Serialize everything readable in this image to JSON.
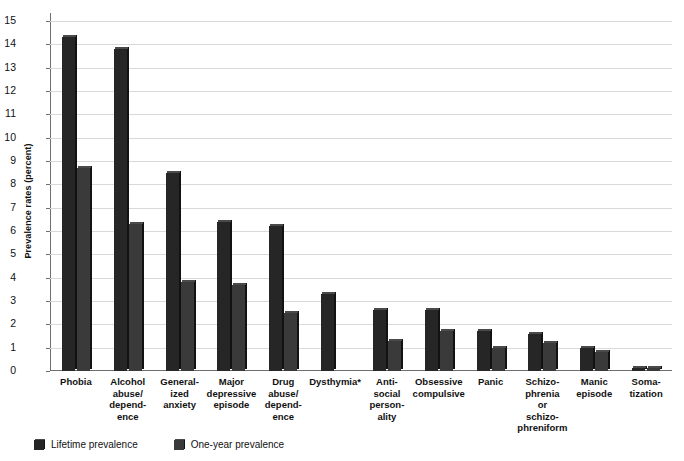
{
  "chart_data": {
    "type": "bar",
    "title": "",
    "xlabel": "",
    "ylabel": "Prevalence rates (percent)",
    "ylim": [
      0,
      15
    ],
    "yticks": [
      0,
      1,
      2,
      3,
      4,
      5,
      6,
      7,
      8,
      9,
      10,
      11,
      12,
      13,
      14,
      15
    ],
    "grid": true,
    "legend_position": "bottom-left",
    "footnote": "*",
    "categories": [
      "Phobia",
      "Alcohol abuse/dependence",
      "Generalized anxiety",
      "Major depressive episode",
      "Drug abuse/dependence",
      "Dysthymia*",
      "Antisocial personality",
      "Obsessive compulsive",
      "Panic",
      "Schizophrenia or schizophreniform",
      "Manic episode",
      "Somatization"
    ],
    "category_lines": [
      [
        "Phobia"
      ],
      [
        "Alcohol",
        "abuse/",
        "depend-",
        "ence"
      ],
      [
        "General-",
        "ized",
        "anxiety"
      ],
      [
        "Major",
        "depressive",
        "episode"
      ],
      [
        "Drug",
        "abuse/",
        "depend-",
        "ence"
      ],
      [
        "Dysthymia*"
      ],
      [
        "Anti-",
        "social",
        "person-",
        "ality"
      ],
      [
        "Obsessive",
        "compulsive"
      ],
      [
        "Panic"
      ],
      [
        "Schizo-",
        "phrenia",
        "or",
        "schizo-",
        "phreniform"
      ],
      [
        "Manic",
        "episode"
      ],
      [
        "Soma-",
        "tization"
      ]
    ],
    "series": [
      {
        "name": "Lifetime prevalence",
        "color": "#262626",
        "values": [
          14.3,
          13.8,
          8.5,
          6.4,
          6.2,
          3.3,
          2.6,
          2.6,
          1.7,
          1.6,
          1.0,
          0.15
        ]
      },
      {
        "name": "One-year prevalence",
        "color": "#3a3a3a",
        "values": [
          8.7,
          6.3,
          3.8,
          3.7,
          2.5,
          null,
          1.3,
          1.7,
          1.0,
          1.2,
          0.8,
          0.15
        ]
      }
    ]
  },
  "legend": {
    "items": [
      {
        "label": "Lifetime prevalence"
      },
      {
        "label": "One-year prevalence"
      }
    ]
  }
}
